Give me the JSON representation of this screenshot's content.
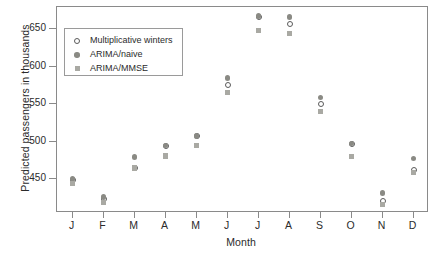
{
  "chart_data": {
    "type": "scatter",
    "title": "",
    "xlabel": "Month",
    "ylabel": "Predicted passengers in thousands",
    "categories": [
      "J",
      "F",
      "M",
      "A",
      "M",
      "J",
      "J",
      "A",
      "S",
      "O",
      "N",
      "D"
    ],
    "ylim": [
      405,
      680
    ],
    "yticks": [
      450,
      500,
      550,
      600,
      650
    ],
    "grid": false,
    "legend_position": "upper-left-inside",
    "series": [
      {
        "name": "Multiplicative winters",
        "marker": "open-circle",
        "color": "#5a5a5a",
        "values": [
          449,
          424,
          465,
          495,
          508,
          576,
          667,
          657,
          551,
          497,
          421,
          463
        ]
      },
      {
        "name": "ARIMA/naive",
        "marker": "filled-circle",
        "color": "#8a8a84",
        "values": [
          450,
          426,
          480,
          495,
          508,
          585,
          668,
          667,
          559,
          498,
          432,
          478
        ]
      },
      {
        "name": "ARIMA/MMSE",
        "marker": "filled-square",
        "color": "#a9a9a3",
        "values": [
          444,
          419,
          465,
          481,
          495,
          566,
          649,
          645,
          540,
          480,
          416,
          459
        ]
      }
    ]
  },
  "axis": {
    "y_tick_labels": [
      "450",
      "500",
      "550",
      "600",
      "650"
    ],
    "x_tick_labels": [
      "J",
      "F",
      "M",
      "A",
      "M",
      "J",
      "J",
      "A",
      "S",
      "O",
      "N",
      "D"
    ]
  },
  "legend": {
    "entries": [
      {
        "label": "Multiplicative winters",
        "marker": "open-circle"
      },
      {
        "label": "ARIMA/naive",
        "marker": "filled-circle"
      },
      {
        "label": "ARIMA/MMSE",
        "marker": "filled-square"
      }
    ]
  },
  "colors": {
    "frame": "#8a8a8a",
    "text": "#2b2b2b",
    "open_circle": "#5a5a5a",
    "filled_circle": "#8a8a84",
    "filled_square": "#a9a9a3",
    "background": "#ffffff"
  }
}
